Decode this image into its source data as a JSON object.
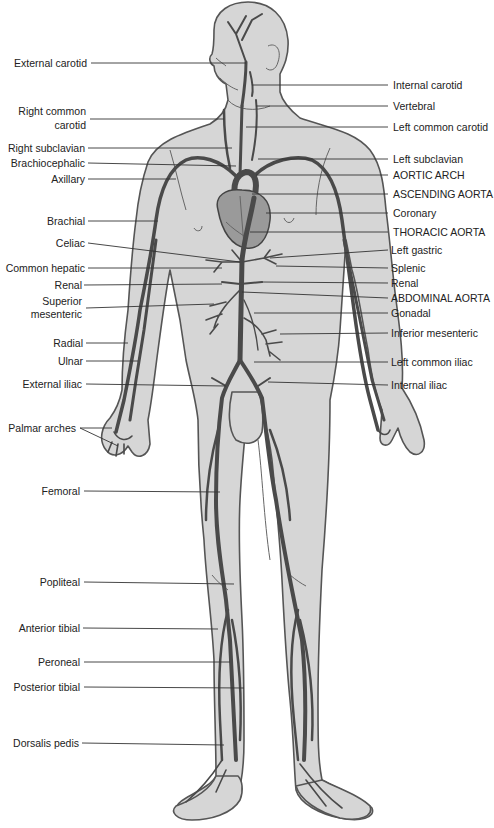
{
  "diagram": {
    "colors": {
      "skin": "#d6d6d6",
      "outline": "#555555",
      "vessel": "#4a4a4a",
      "heart": "#9a9a9a",
      "text": "#222222"
    },
    "labels_left": [
      {
        "id": "external-carotid",
        "text": "External carotid",
        "y": 63
      },
      {
        "id": "right-common-carotid",
        "text": "Right common",
        "text2": "carotid",
        "y": 113
      },
      {
        "id": "right-subclavian",
        "text": "Right subclavian",
        "y": 148
      },
      {
        "id": "brachiocephalic",
        "text": "Brachiocephalic",
        "y": 163
      },
      {
        "id": "axillary",
        "text": "Axillary",
        "y": 179
      },
      {
        "id": "brachial",
        "text": "Brachial",
        "y": 221
      },
      {
        "id": "celiac",
        "text": "Celiac",
        "y": 243
      },
      {
        "id": "common-hepatic",
        "text": "Common hepatic",
        "y": 268
      },
      {
        "id": "renal-left-label",
        "text": "Renal",
        "y": 285
      },
      {
        "id": "superior-mesenteric",
        "text": "Superior",
        "text2": "mesenteric",
        "y": 303
      },
      {
        "id": "radial",
        "text": "Radial",
        "y": 343
      },
      {
        "id": "ulnar",
        "text": "Ulnar",
        "y": 361
      },
      {
        "id": "external-iliac",
        "text": "External iliac",
        "y": 384
      },
      {
        "id": "palmar-arches",
        "text": "Palmar arches",
        "y": 428
      },
      {
        "id": "femoral",
        "text": "Femoral",
        "y": 491
      },
      {
        "id": "popliteal",
        "text": "Popliteal",
        "y": 582
      },
      {
        "id": "anterior-tibial",
        "text": "Anterior tibial",
        "y": 628
      },
      {
        "id": "peroneal",
        "text": "Peroneal",
        "y": 662
      },
      {
        "id": "posterior-tibial",
        "text": "Posterior tibial",
        "y": 687
      },
      {
        "id": "dorsalis-pedis",
        "text": "Dorsalis pedis",
        "y": 743
      }
    ],
    "labels_right": [
      {
        "id": "internal-carotid",
        "text": "Internal carotid",
        "y": 85
      },
      {
        "id": "vertebral",
        "text": "Vertebral",
        "y": 106
      },
      {
        "id": "left-common-carotid",
        "text": "Left common carotid",
        "y": 127
      },
      {
        "id": "left-subclavian",
        "text": "Left subclavian",
        "y": 159
      },
      {
        "id": "aortic-arch",
        "text": "AORTIC ARCH",
        "y": 175
      },
      {
        "id": "ascending-aorta",
        "text": "ASCENDING AORTA",
        "y": 194
      },
      {
        "id": "coronary",
        "text": "Coronary",
        "y": 213
      },
      {
        "id": "thoracic-aorta",
        "text": "THORACIC AORTA",
        "y": 232
      },
      {
        "id": "left-gastric",
        "text": "Left gastric",
        "y": 250
      },
      {
        "id": "splenic",
        "text": "Splenic",
        "y": 268
      },
      {
        "id": "renal-right-label",
        "text": "Renal",
        "y": 283
      },
      {
        "id": "abdominal-aorta",
        "text": "ABDOMINAL AORTA",
        "y": 298
      },
      {
        "id": "gonadal",
        "text": "Gonadal",
        "y": 313
      },
      {
        "id": "inferior-mesenteric",
        "text": "Inferior mesenteric",
        "y": 333
      },
      {
        "id": "left-common-iliac",
        "text": "Left common iliac",
        "y": 362
      },
      {
        "id": "internal-iliac",
        "text": "Internal iliac",
        "y": 385
      }
    ],
    "caption": "Figure: Major arteries"
  }
}
